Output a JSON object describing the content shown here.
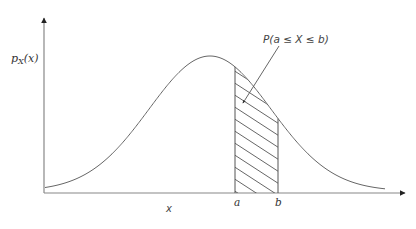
{
  "diagram": {
    "type": "normal-distribution-probability-area",
    "y_axis_label": {
      "base": "p",
      "sub": "X",
      "rest": "(x)"
    },
    "x_axis_label": "x",
    "bound_a_label": "a",
    "bound_b_label": "b",
    "area_label": "P(a ≤ X ≤ b)",
    "colors": {
      "stroke": "#555555",
      "text": "#333333",
      "background": "#ffffff"
    },
    "curve": {
      "mean_px": 210,
      "sigma_px": 61,
      "peak_y_px": 56,
      "baseline_y_px": 191
    },
    "bounds_px": {
      "a": 235,
      "b": 278
    }
  }
}
